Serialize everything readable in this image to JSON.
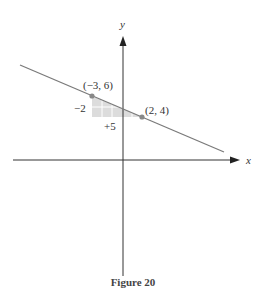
{
  "figure": {
    "caption": "Figure 20",
    "x_axis_label": "x",
    "y_axis_label": "y",
    "points": [
      {
        "label": "(−3, 6)",
        "x": -3,
        "y": 6
      },
      {
        "label": "(2, 4)",
        "x": 2,
        "y": 4
      }
    ],
    "rise_label": "−2",
    "run_label": "+5",
    "colors": {
      "line": "#7a7a7a",
      "axis": "#333333",
      "point": "#888888",
      "shade": "#d9d9d9"
    }
  }
}
